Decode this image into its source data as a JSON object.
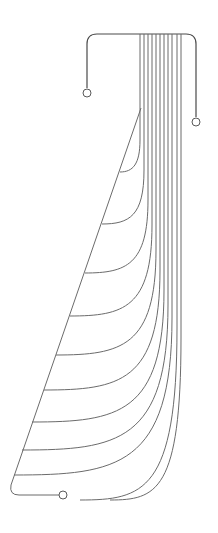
{
  "diagram": {
    "kind": "line drawing",
    "stroke_color": "#6b6b6b",
    "frame_color": "#4a4a4a",
    "background": "#ffffff",
    "top_bar": {
      "x1": 87,
      "x2": 196,
      "y": 34
    },
    "left_lead": {
      "x": 87,
      "y_top": 45,
      "y_bottom": 88,
      "terminal": {
        "cx": 87,
        "cy": 93,
        "r": 4
      }
    },
    "right_lead": {
      "x": 196,
      "y_top": 45,
      "y_bottom": 117,
      "terminal": {
        "cx": 196,
        "cy": 122,
        "r": 4
      }
    },
    "bottom_lead": {
      "terminal": {
        "cx": 63,
        "cy": 495,
        "r": 4
      }
    },
    "diagonal": {
      "x1": 141,
      "y1": 108,
      "x2": 11,
      "y2": 485
    },
    "wires": [
      {
        "x": 140,
        "bend_y": 140,
        "end": [
          120,
          172
        ]
      },
      {
        "x": 144,
        "bend_y": 170,
        "end": [
          102,
          224
        ]
      },
      {
        "x": 148,
        "bend_y": 200,
        "end": [
          85,
          273
        ]
      },
      {
        "x": 152,
        "bend_y": 225,
        "end": [
          70,
          316
        ]
      },
      {
        "x": 156,
        "bend_y": 250,
        "end": [
          56,
          355
        ]
      },
      {
        "x": 160,
        "bend_y": 270,
        "end": [
          44,
          390
        ]
      },
      {
        "x": 164,
        "bend_y": 290,
        "end": [
          32,
          422
        ]
      },
      {
        "x": 168,
        "bend_y": 305,
        "end": [
          22,
          450
        ]
      },
      {
        "x": 172,
        "bend_y": 318,
        "end": [
          14,
          475
        ]
      },
      {
        "x": 177,
        "bend_y": 328,
        "end": [
          80,
          500
        ]
      },
      {
        "x": 181,
        "bend_y": 338,
        "end": [
          110,
          500
        ]
      }
    ]
  }
}
